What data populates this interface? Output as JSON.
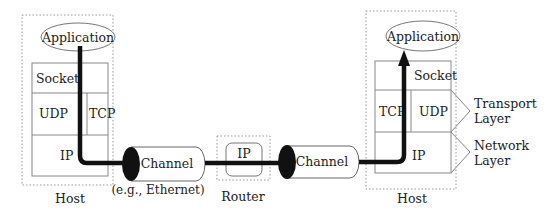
{
  "diagram": {
    "left_host": {
      "label": "Host",
      "application": "Application",
      "layers": {
        "socket": "Socket",
        "udp": "UDP",
        "tcp": "TCP",
        "ip": "IP"
      }
    },
    "channel_left": {
      "label": "Channel",
      "caption": "(e.g., Ethernet)"
    },
    "router": {
      "label": "Router",
      "ip": "IP"
    },
    "channel_right": {
      "label": "Channel"
    },
    "right_host": {
      "label": "Host",
      "application": "Application",
      "layers": {
        "socket": "Socket",
        "tcp": "TCP",
        "udp": "UDP",
        "ip": "IP"
      }
    },
    "layer_labels": {
      "transport": [
        "Transport",
        "Layer"
      ],
      "network": [
        "Network",
        "Layer"
      ]
    },
    "colors": {
      "line": "#111111",
      "box_stroke": "#888888",
      "dotted": "#999999"
    }
  }
}
